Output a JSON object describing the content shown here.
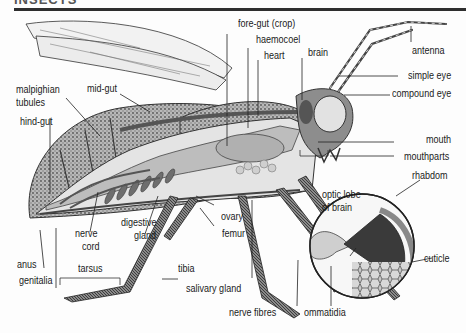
{
  "header": {
    "title": "INSECTS"
  },
  "diagram": {
    "colors": {
      "rule": "#2e2e2e",
      "organ_fill": "#bdbdbd",
      "organ_dark": "#6e6e6e",
      "body_texture": "#8a8a8a",
      "eye_fill": "#e2e2e2"
    },
    "labels": {
      "fore_gut": "fore-gut (crop)",
      "haemocoel": "haemocoel",
      "heart": "heart",
      "brain": "brain",
      "antenna": "antenna",
      "malpighian": "malpighian",
      "tubules": "tubules",
      "mid_gut": "mid-gut",
      "simple_eye": "simple eye",
      "compound_eye": "compound eye",
      "hind_gut": "hind-gut",
      "mouth": "mouth",
      "mouthparts": "mouthparts",
      "rhabdom": "rhabdom",
      "optic_lobe_1": "optic lobe",
      "optic_lobe_2": "of brain",
      "ovary": "ovary",
      "femur": "femur",
      "nerve_1": "nerve",
      "nerve_2": "cord",
      "digestive_1": "digestive",
      "digestive_2": "gland",
      "cuticle": "cuticle",
      "anus": "anus",
      "genitalia": "genitalia",
      "tarsus": "tarsus",
      "tibia": "tibia",
      "salivary_gland": "salivary gland",
      "nerve_fibres": "nerve fibres",
      "ommatidia": "ommatidia"
    }
  }
}
